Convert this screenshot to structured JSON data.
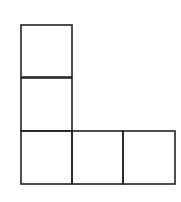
{
  "diagram": {
    "title": "",
    "shape": "L-shaped arrangement of five unit squares",
    "stroke_color": "#222222",
    "background": "#ffffff",
    "cell_size": 51,
    "squares": [
      {
        "id": "sq-top",
        "col": 0,
        "row": 0
      },
      {
        "id": "sq-middle",
        "col": 0,
        "row": 1
      },
      {
        "id": "sq-bottom-left",
        "col": 0,
        "row": 2
      },
      {
        "id": "sq-bottom-center",
        "col": 1,
        "row": 2
      },
      {
        "id": "sq-bottom-right",
        "col": 2,
        "row": 2
      }
    ]
  }
}
